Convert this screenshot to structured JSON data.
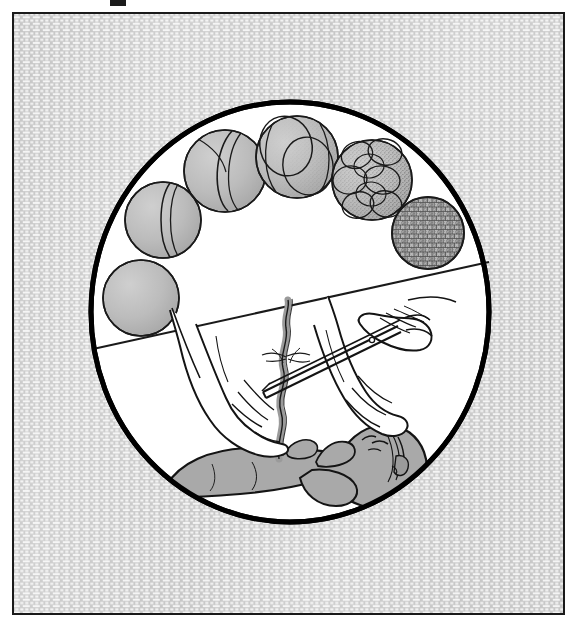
{
  "figure": {
    "kind": "line-art-illustration",
    "title_text": "",
    "caption_text": "",
    "frame": {
      "x": 12,
      "y": 12,
      "width": 553,
      "height": 603,
      "border_color": "#1a1a1a",
      "border_width": 2,
      "fill_color": "#ffffff"
    },
    "register_mark": {
      "name": "top-register-mark",
      "x": 110,
      "y": 0,
      "width": 16,
      "height": 6,
      "color": "#1c1c1c"
    },
    "background_texture": {
      "name": "stipple-brick-texture",
      "base_color": "#c9c9c9",
      "cell_color": "#f2f2f2",
      "cell_width": 5,
      "cell_height": 3.2,
      "description": "dense offset brick-like stipple fill covering the framed panel"
    },
    "circle": {
      "name": "main-circle",
      "cx": 290,
      "cy": 312,
      "rx": 202,
      "ry": 213,
      "stroke_color": "#000000",
      "stroke_width": 5,
      "fill_color": "#ffffff"
    },
    "divider": {
      "name": "diagonal-divider",
      "x1": 93,
      "y1": 349,
      "x2": 489,
      "y2": 262,
      "stroke_color": "#1a1a1a",
      "stroke_width": 2
    }
  },
  "palette": {
    "ink": "#1a1a1a",
    "outline": "#000000",
    "paper": "#ffffff",
    "cell_fill": "#b4b4b4",
    "cell_fill_light": "#c2c2c2",
    "cell_shadow": "#8e8e8e",
    "skin_fill": "#a9a9a9",
    "skin_light": "#ffffff",
    "cord_fill": "#9a9a9a",
    "texture_base": "#c9c9c9",
    "texture_cell": "#f2f2f2"
  },
  "upper_panel": {
    "name": "cleavage-stage-sequence",
    "label": "",
    "arrangement": "arc-from-lower-left-to-lower-right",
    "stages": [
      {
        "name": "zygote-one-cell",
        "order": 1,
        "cells": 1,
        "cx": 141,
        "cy": 298,
        "r": 38,
        "shading": "stipple-right",
        "label": ""
      },
      {
        "name": "two-cell-stage",
        "order": 2,
        "cells": 2,
        "cx": 163,
        "cy": 220,
        "r": 38,
        "shading": "stipple-right",
        "label": ""
      },
      {
        "name": "two-cell-oblique",
        "order": 3,
        "cells": 2,
        "cx": 225,
        "cy": 171,
        "r": 41,
        "shading": "stipple-right",
        "label": ""
      },
      {
        "name": "four-cell-stage",
        "order": 4,
        "cells": 4,
        "cx": 297,
        "cy": 157,
        "r": 41,
        "shading": "stipple-right",
        "label": ""
      },
      {
        "name": "eight-cell-stage",
        "order": 5,
        "cells": 8,
        "cx": 372,
        "cy": 180,
        "r": 40,
        "shading": "stipple-right",
        "label": ""
      },
      {
        "name": "morula-blastocyst",
        "order": 6,
        "cells": 0,
        "cx": 428,
        "cy": 233,
        "r": 36,
        "shading": "dense-mosaic",
        "label": ""
      }
    ]
  },
  "lower_panel": {
    "name": "umbilical-cord-cutting-scene",
    "label": "",
    "elements": [
      {
        "name": "newborn-infant",
        "description": "supine newborn with head to the right, arms and legs drawn in"
      },
      {
        "name": "left-hand",
        "description": "gloved clinician hand grasping cord near abdomen"
      },
      {
        "name": "right-hand",
        "description": "clinician hand holding scissors"
      },
      {
        "name": "umbilical-cord",
        "description": "shaded wavy cord rising from the navel"
      },
      {
        "name": "cord-clamp-tie",
        "description": "thread tie knotted around the cord above the cut point"
      },
      {
        "name": "scissors",
        "description": "long straight surgical scissors cutting the cord"
      }
    ]
  },
  "texts": {
    "visible_strings": []
  }
}
